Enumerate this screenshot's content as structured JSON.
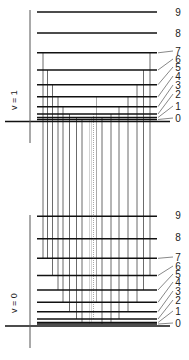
{
  "diagram": {
    "title": "",
    "colors": {
      "level": "#111111",
      "axis": "#555555",
      "transition": "#6b6b6b",
      "transition_dotted": "#a8a8a8",
      "label": "#222222"
    },
    "states": [
      {
        "name": "v = 1",
        "label": "v = 1",
        "axis": {
          "x": 30,
          "y_top": 10,
          "y_bottom": 143
        },
        "baseline": {
          "y": 121.5,
          "x1": 5,
          "x2": 170
        },
        "levels": [
          {
            "J": "0",
            "y": 119.5
          },
          {
            "J": "1",
            "y": 117.5
          },
          {
            "J": "2",
            "y": 114
          },
          {
            "J": "3",
            "y": 106.7
          },
          {
            "J": "4",
            "y": 96.8
          },
          {
            "J": "5",
            "y": 84.7
          },
          {
            "J": "6",
            "y": 70
          },
          {
            "J": "7",
            "y": 52.8
          },
          {
            "J": "8",
            "y": 33
          },
          {
            "J": "9",
            "y": 12
          }
        ]
      },
      {
        "name": "v = 0",
        "label": "v = 0",
        "axis": {
          "x": 30,
          "y_top": 215,
          "y_bottom": 348
        },
        "baseline": {
          "y": 326,
          "x1": 5,
          "x2": 170
        },
        "levels": [
          {
            "J": "0",
            "y": 324
          },
          {
            "J": "1",
            "y": 322.5
          },
          {
            "J": "2",
            "y": 319
          },
          {
            "J": "3",
            "y": 311.7
          },
          {
            "J": "4",
            "y": 302.3
          },
          {
            "J": "5",
            "y": 290
          },
          {
            "J": "6",
            "y": 275.5
          },
          {
            "J": "7",
            "y": 258.3
          },
          {
            "J": "8",
            "y": 238.7
          },
          {
            "J": "9",
            "y": 216.3
          }
        ]
      }
    ],
    "level_x1": 37,
    "level_x2": 157,
    "transitions": [
      {
        "branch": "P",
        "x": 43,
        "upper_J": "7",
        "lower_J": "8",
        "y1": 52.8,
        "y2": 258.3
      },
      {
        "branch": "P",
        "x": 47.5,
        "upper_J": "6",
        "lower_J": "7",
        "y1": 70,
        "y2": 258.3
      },
      {
        "branch": "P",
        "x": 52.5,
        "upper_J": "5",
        "lower_J": "6",
        "y1": 84.7,
        "y2": 275.5
      },
      {
        "branch": "P",
        "x": 58,
        "upper_J": "4",
        "lower_J": "5",
        "y1": 96.8,
        "y2": 290
      },
      {
        "branch": "P",
        "x": 63,
        "upper_J": "3",
        "lower_J": "4",
        "y1": 106.7,
        "y2": 302.3
      },
      {
        "branch": "P",
        "x": 69.5,
        "upper_J": "2",
        "lower_J": "3",
        "y1": 114,
        "y2": 311.7
      },
      {
        "branch": "P",
        "x": 76.5,
        "upper_J": "1",
        "lower_J": "2",
        "y1": 117.5,
        "y2": 319
      },
      {
        "branch": "P",
        "x": 82,
        "upper_J": "0",
        "lower_J": "1",
        "y1": 119.5,
        "y2": 322.5
      },
      {
        "branch": "Q",
        "x": 89.5,
        "style": "dotted",
        "y1": 119.5,
        "y2": 324
      },
      {
        "branch": "Q",
        "x": 91.5,
        "style": "dotted",
        "y1": 117.5,
        "y2": 322.5
      },
      {
        "branch": "Q",
        "x": 93.5,
        "style": "dotted",
        "y1": 114,
        "y2": 319
      },
      {
        "branch": "Q",
        "x": 96.5,
        "style": "light",
        "y1": 96.8,
        "y2": 302.3
      },
      {
        "branch": "R",
        "x": 102,
        "upper_J": "1",
        "lower_J": "0",
        "y1": 117.5,
        "y2": 324
      },
      {
        "branch": "R",
        "x": 111,
        "upper_J": "2",
        "lower_J": "1",
        "y1": 114,
        "y2": 322.5
      },
      {
        "branch": "R",
        "x": 119,
        "upper_J": "3",
        "lower_J": "2",
        "y1": 106.7,
        "y2": 319
      },
      {
        "branch": "R",
        "x": 128,
        "upper_J": "4",
        "lower_J": "3",
        "y1": 96.8,
        "y2": 311.7
      },
      {
        "branch": "R",
        "x": 137,
        "upper_J": "5",
        "lower_J": "4",
        "y1": 84.7,
        "y2": 302.3
      },
      {
        "branch": "R",
        "x": 143.5,
        "upper_J": "6",
        "lower_J": "5",
        "y1": 70,
        "y2": 290
      },
      {
        "branch": "R",
        "x": 150,
        "upper_J": "7",
        "lower_J": "6",
        "y1": 52.8,
        "y2": 275.5
      }
    ],
    "label_positions": {
      "upper": [
        {
          "J": "9",
          "x": 178,
          "y": 16
        },
        {
          "J": "8",
          "x": 178,
          "y": 37
        },
        {
          "J": "7",
          "x": 178,
          "y": 55
        },
        {
          "J": "6",
          "x": 178,
          "y": 63
        },
        {
          "J": "5",
          "x": 178,
          "y": 71
        },
        {
          "J": "4",
          "x": 178,
          "y": 80
        },
        {
          "J": "3",
          "x": 178,
          "y": 89
        },
        {
          "J": "2",
          "x": 178,
          "y": 98
        },
        {
          "J": "1",
          "x": 178,
          "y": 110
        },
        {
          "J": "0",
          "x": 178,
          "y": 122
        }
      ],
      "lower": [
        {
          "J": "9",
          "x": 178,
          "y": 219
        },
        {
          "J": "8",
          "x": 178,
          "y": 241
        },
        {
          "J": "7",
          "x": 178,
          "y": 261
        },
        {
          "J": "6",
          "x": 178,
          "y": 270
        },
        {
          "J": "5",
          "x": 178,
          "y": 278
        },
        {
          "J": "4",
          "x": 178,
          "y": 286
        },
        {
          "J": "3",
          "x": 178,
          "y": 295
        },
        {
          "J": "2",
          "x": 178,
          "y": 304
        },
        {
          "J": "1",
          "x": 178,
          "y": 315
        },
        {
          "J": "0",
          "x": 178,
          "y": 327
        }
      ]
    },
    "state_label_positions": [
      {
        "label": "v = 1",
        "x": 17,
        "y": 100
      },
      {
        "label": "v = 0",
        "x": 17,
        "y": 303
      }
    ]
  }
}
